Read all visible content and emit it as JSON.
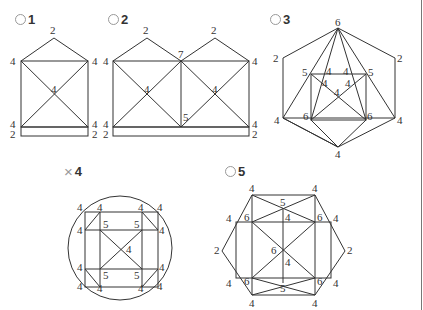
{
  "figures": [
    {
      "id": "1",
      "mark": "circle",
      "mark_icon": "circle-mark-icon",
      "label": "1",
      "vertex_labels": [
        "2",
        "4",
        "4",
        "4",
        "4",
        "4",
        "2",
        "2"
      ]
    },
    {
      "id": "2",
      "mark": "circle",
      "mark_icon": "circle-mark-icon",
      "label": "2",
      "vertex_labels": [
        "2",
        "2",
        "4",
        "7",
        "4",
        "4",
        "4",
        "5",
        "4",
        "4",
        "2",
        "2"
      ]
    },
    {
      "id": "3",
      "mark": "circle",
      "mark_icon": "circle-mark-icon",
      "label": "3",
      "vertex_labels": [
        "6",
        "2",
        "2",
        "5",
        "5",
        "4",
        "4",
        "4",
        "4",
        "4",
        "6",
        "6",
        "4",
        "4",
        "4"
      ]
    },
    {
      "id": "4",
      "mark": "cross",
      "mark_icon": "cross-mark-icon",
      "mark_glyph": "×",
      "label": "4",
      "vertex_labels": [
        "4",
        "4",
        "4",
        "4",
        "4",
        "5",
        "5",
        "4",
        "4",
        "4",
        "5",
        "5",
        "4",
        "4",
        "4",
        "4",
        "4"
      ]
    },
    {
      "id": "5",
      "mark": "circle",
      "mark_icon": "circle-mark-icon",
      "label": "5",
      "vertex_labels": [
        "4",
        "4",
        "5",
        "4",
        "6",
        "4",
        "6",
        "4",
        "2",
        "6",
        "2",
        "4",
        "4",
        "6",
        "6",
        "4",
        "5",
        "4",
        "4"
      ]
    }
  ],
  "colors": {
    "line": "#333333",
    "text": "#333333",
    "mark": "#999999",
    "background": "#ffffff"
  }
}
